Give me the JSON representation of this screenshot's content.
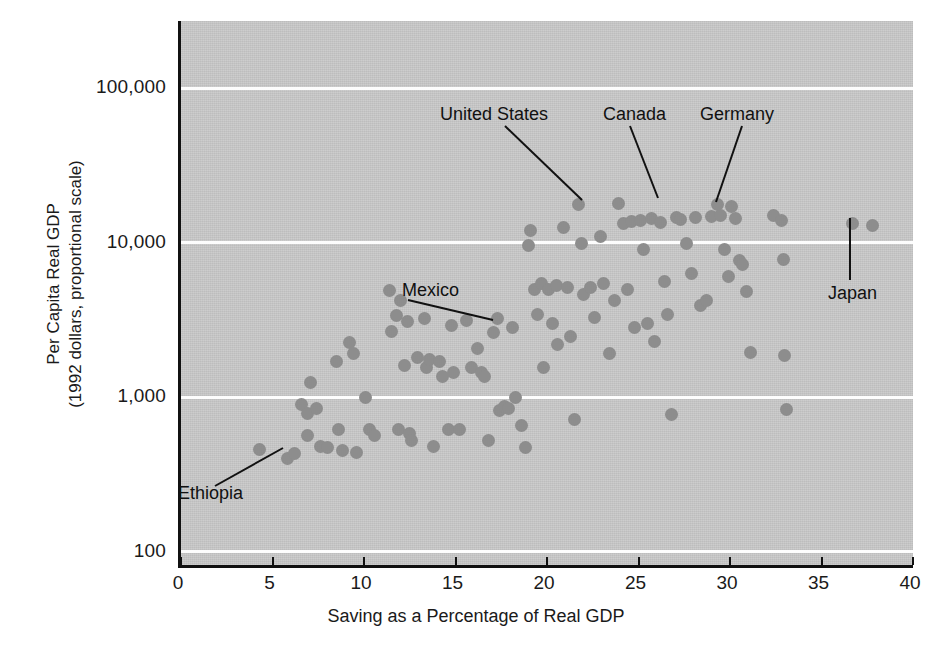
{
  "chart_data": {
    "type": "scatter",
    "title": "",
    "xlabel": "Saving as a Percentage of Real GDP",
    "ylabel": "Per Capita Real GDP\n(1992 dollars, proportional scale)",
    "ylabel_line1": "Per Capita Real GDP",
    "ylabel_line2": "(1992 dollars, proportional scale)",
    "xlim": [
      0,
      40
    ],
    "ylim": [
      100,
      200000
    ],
    "yscale": "log",
    "xticks": [
      0,
      5,
      10,
      15,
      20,
      25,
      30,
      35,
      40
    ],
    "xticklabels": [
      "0",
      "5",
      "10",
      "15",
      "20",
      "25",
      "30",
      "35",
      "40"
    ],
    "yticks": [
      100,
      1000,
      10000,
      100000
    ],
    "yticklabels": [
      "100",
      "1,000",
      "10,000",
      "100,000"
    ],
    "grid": "horizontal-white-at-decades",
    "legend": "none",
    "marker_color": "#8d8d8d",
    "panel_color": "#c9c9c9",
    "points": [
      {
        "x": 4.3,
        "y": 460
      },
      {
        "x": 5.8,
        "y": 400,
        "label": "Ethiopia"
      },
      {
        "x": 6.2,
        "y": 430
      },
      {
        "x": 6.6,
        "y": 900
      },
      {
        "x": 6.9,
        "y": 780
      },
      {
        "x": 6.9,
        "y": 560
      },
      {
        "x": 7.1,
        "y": 1250
      },
      {
        "x": 7.4,
        "y": 840
      },
      {
        "x": 7.6,
        "y": 480
      },
      {
        "x": 8.0,
        "y": 470
      },
      {
        "x": 8.5,
        "y": 1700
      },
      {
        "x": 8.6,
        "y": 620
      },
      {
        "x": 8.8,
        "y": 450
      },
      {
        "x": 9.2,
        "y": 2250
      },
      {
        "x": 9.4,
        "y": 1900
      },
      {
        "x": 9.6,
        "y": 440
      },
      {
        "x": 10.1,
        "y": 1000
      },
      {
        "x": 10.3,
        "y": 620
      },
      {
        "x": 10.6,
        "y": 560
      },
      {
        "x": 11.4,
        "y": 4900
      },
      {
        "x": 11.5,
        "y": 2650
      },
      {
        "x": 11.8,
        "y": 3350
      },
      {
        "x": 11.9,
        "y": 620
      },
      {
        "x": 12.0,
        "y": 4200
      },
      {
        "x": 12.2,
        "y": 1600
      },
      {
        "x": 12.4,
        "y": 3100
      },
      {
        "x": 12.5,
        "y": 580
      },
      {
        "x": 12.6,
        "y": 520
      },
      {
        "x": 12.9,
        "y": 1800
      },
      {
        "x": 13.3,
        "y": 3200
      },
      {
        "x": 13.4,
        "y": 1550
      },
      {
        "x": 13.6,
        "y": 1750
      },
      {
        "x": 13.8,
        "y": 480
      },
      {
        "x": 14.1,
        "y": 1700
      },
      {
        "x": 14.3,
        "y": 1350
      },
      {
        "x": 14.6,
        "y": 620
      },
      {
        "x": 14.8,
        "y": 2900
      },
      {
        "x": 14.9,
        "y": 1450
      },
      {
        "x": 15.2,
        "y": 620
      },
      {
        "x": 15.6,
        "y": 3150
      },
      {
        "x": 15.9,
        "y": 1550
      },
      {
        "x": 16.2,
        "y": 2050
      },
      {
        "x": 16.4,
        "y": 1450
      },
      {
        "x": 16.6,
        "y": 1350
      },
      {
        "x": 16.8,
        "y": 520
      },
      {
        "x": 17.1,
        "y": 2600
      },
      {
        "x": 17.3,
        "y": 3200
      },
      {
        "x": 17.4,
        "y": 820
      },
      {
        "x": 17.7,
        "y": 870
      },
      {
        "x": 17.9,
        "y": 840
      },
      {
        "x": 18.1,
        "y": 2800
      },
      {
        "x": 18.3,
        "y": 1000
      },
      {
        "x": 18.6,
        "y": 650
      },
      {
        "x": 18.8,
        "y": 470
      },
      {
        "x": 19.0,
        "y": 9500
      },
      {
        "x": 19.1,
        "y": 12000
      },
      {
        "x": 19.3,
        "y": 4950
      },
      {
        "x": 19.5,
        "y": 3400
      },
      {
        "x": 19.7,
        "y": 5400
      },
      {
        "x": 19.8,
        "y": 1550
      },
      {
        "x": 20.1,
        "y": 5000,
        "label": "Mexico"
      },
      {
        "x": 20.3,
        "y": 3000
      },
      {
        "x": 20.5,
        "y": 5300
      },
      {
        "x": 20.6,
        "y": 2200
      },
      {
        "x": 20.9,
        "y": 12500
      },
      {
        "x": 21.1,
        "y": 5100
      },
      {
        "x": 21.3,
        "y": 2450
      },
      {
        "x": 21.5,
        "y": 720
      },
      {
        "x": 21.7,
        "y": 17500,
        "label": "United States"
      },
      {
        "x": 21.9,
        "y": 9800
      },
      {
        "x": 22.0,
        "y": 4600
      },
      {
        "x": 22.4,
        "y": 5150
      },
      {
        "x": 22.6,
        "y": 3250
      },
      {
        "x": 22.9,
        "y": 11000
      },
      {
        "x": 23.1,
        "y": 5400
      },
      {
        "x": 23.4,
        "y": 1900
      },
      {
        "x": 23.7,
        "y": 4200
      },
      {
        "x": 23.9,
        "y": 17800,
        "label": "Canada"
      },
      {
        "x": 24.2,
        "y": 13200
      },
      {
        "x": 24.4,
        "y": 5000
      },
      {
        "x": 24.6,
        "y": 13600
      },
      {
        "x": 24.8,
        "y": 2800
      },
      {
        "x": 25.1,
        "y": 13800
      },
      {
        "x": 25.3,
        "y": 9000
      },
      {
        "x": 25.5,
        "y": 3000
      },
      {
        "x": 25.7,
        "y": 14200
      },
      {
        "x": 25.9,
        "y": 2300
      },
      {
        "x": 26.2,
        "y": 13500
      },
      {
        "x": 26.4,
        "y": 5600
      },
      {
        "x": 26.6,
        "y": 3400
      },
      {
        "x": 26.8,
        "y": 770
      },
      {
        "x": 27.1,
        "y": 14500
      },
      {
        "x": 27.3,
        "y": 14000
      },
      {
        "x": 27.6,
        "y": 9800
      },
      {
        "x": 27.9,
        "y": 6300
      },
      {
        "x": 28.1,
        "y": 14600
      },
      {
        "x": 28.4,
        "y": 3900
      },
      {
        "x": 28.7,
        "y": 4200
      },
      {
        "x": 29.0,
        "y": 14800
      },
      {
        "x": 29.3,
        "y": 17600,
        "label": "Germany"
      },
      {
        "x": 29.5,
        "y": 15000
      },
      {
        "x": 29.7,
        "y": 9000
      },
      {
        "x": 29.9,
        "y": 6000
      },
      {
        "x": 30.1,
        "y": 17000
      },
      {
        "x": 30.3,
        "y": 14200
      },
      {
        "x": 30.5,
        "y": 7600
      },
      {
        "x": 30.7,
        "y": 7200
      },
      {
        "x": 30.9,
        "y": 4800
      },
      {
        "x": 31.1,
        "y": 1950
      },
      {
        "x": 32.4,
        "y": 15000
      },
      {
        "x": 32.8,
        "y": 13800
      },
      {
        "x": 32.9,
        "y": 7800
      },
      {
        "x": 33.0,
        "y": 1850
      },
      {
        "x": 33.1,
        "y": 830
      },
      {
        "x": 36.7,
        "y": 13300,
        "label": "Japan"
      },
      {
        "x": 37.8,
        "y": 12800
      }
    ],
    "annotations": [
      {
        "text": "United States",
        "label_x": 440,
        "label_y": 104,
        "leader": [
          [
            505,
            126
          ],
          [
            582,
            200
          ]
        ]
      },
      {
        "text": "Canada",
        "label_x": 603,
        "label_y": 104,
        "leader": [
          [
            630,
            126
          ],
          [
            658,
            198
          ]
        ]
      },
      {
        "text": "Germany",
        "label_x": 700,
        "label_y": 104,
        "leader": [
          [
            742,
            126
          ],
          [
            716,
            202
          ]
        ]
      },
      {
        "text": "Mexico",
        "label_x": 402,
        "label_y": 280,
        "leader": [
          [
            408,
            300
          ],
          [
            493,
            320
          ]
        ]
      },
      {
        "text": "Japan",
        "label_x": 828,
        "label_y": 283,
        "leader": [
          [
            850,
            280
          ],
          [
            850,
            218
          ]
        ]
      },
      {
        "text": "Ethiopia",
        "label_x": 178,
        "label_y": 483,
        "leader": [
          [
            215,
            486
          ],
          [
            283,
            448
          ]
        ]
      }
    ]
  }
}
